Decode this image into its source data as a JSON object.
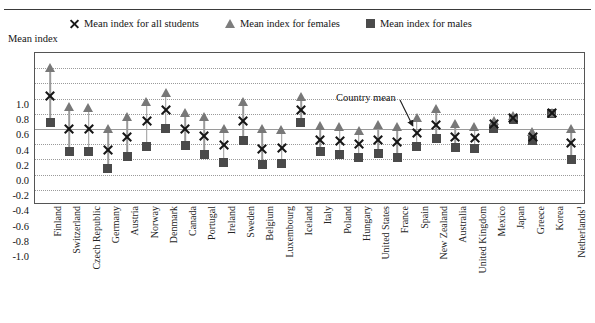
{
  "legend": {
    "items": [
      {
        "icon": "x-marker-icon",
        "label": "Mean index for all students"
      },
      {
        "icon": "triangle-marker-icon",
        "label": "Mean index for females"
      },
      {
        "icon": "square-marker-icon",
        "label": "Mean index for males"
      }
    ]
  },
  "annotation": {
    "label": "Country mean",
    "points_to": "Spain"
  },
  "axis_title": "Mean index",
  "colors": {
    "all_students": "#161616",
    "females": "#787878",
    "males": "#4a4a4a",
    "grid": "#9a9a9a",
    "frame": "#555555"
  },
  "chart_data": {
    "type": "scatter",
    "title": "Mean index",
    "xlabel": "",
    "ylabel": "Mean index",
    "ylim": [
      -1.0,
      1.0
    ],
    "ytick_values": [
      1.0,
      0.8,
      0.6,
      0.4,
      0.2,
      0.0,
      -0.2,
      -0.4,
      -0.6,
      -0.8,
      -1.0
    ],
    "ytick_labels": [
      "1.0",
      "0.8",
      "0.6",
      "0.4",
      "0.2",
      "0.0",
      "-0.2",
      "-0.4",
      "-0.6",
      "-0.8",
      "-1.0"
    ],
    "grid": true,
    "legend_position": "top",
    "categories": [
      "Finland",
      "Switzerland",
      "Czech Republic",
      "Germany",
      "Austria",
      "Norway",
      "Denmark",
      "Canada",
      "Portugal",
      "Ireland",
      "Sweden",
      "Belgium",
      "Luxembourg",
      "Iceland",
      "Italy",
      "Poland",
      "Hungary",
      "United States",
      "France",
      "Spain",
      "New Zealand",
      "Australia",
      "United Kingdom",
      "Mexico",
      "Japan",
      "Greece",
      "Korea",
      "Netherlands¹"
    ],
    "series": [
      {
        "name": "Mean index for all students",
        "marker": "x",
        "values": [
          0.44,
          0.0,
          0.0,
          -0.27,
          -0.1,
          0.1,
          0.25,
          0.0,
          -0.09,
          -0.21,
          0.1,
          -0.26,
          -0.25,
          0.25,
          -0.14,
          -0.16,
          -0.2,
          -0.14,
          -0.17,
          -0.05,
          0.05,
          -0.1,
          -0.12,
          0.07,
          0.15,
          -0.1,
          0.21,
          -0.18
        ]
      },
      {
        "name": "Mean index for females",
        "marker": "triangle",
        "values": [
          0.8,
          0.29,
          0.27,
          0.0,
          0.16,
          0.35,
          0.47,
          0.21,
          0.16,
          0.0,
          0.35,
          0.0,
          -0.01,
          0.42,
          0.04,
          0.03,
          -0.02,
          0.05,
          0.03,
          0.15,
          0.26,
          0.07,
          0.03,
          0.11,
          0.17,
          -0.04,
          0.21,
          0.0
        ]
      },
      {
        "name": "Mean index for males",
        "marker": "square",
        "values": [
          0.08,
          -0.3,
          -0.29,
          -0.52,
          -0.36,
          -0.23,
          0.01,
          -0.22,
          -0.34,
          -0.44,
          -0.15,
          -0.47,
          -0.45,
          0.08,
          -0.3,
          -0.34,
          -0.38,
          -0.32,
          -0.38,
          -0.23,
          -0.13,
          -0.24,
          -0.26,
          0.01,
          0.13,
          -0.15,
          0.21,
          -0.4
        ]
      }
    ]
  }
}
